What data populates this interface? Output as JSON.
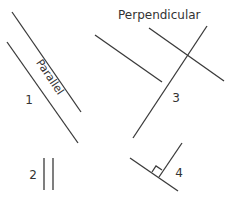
{
  "diagram": {
    "title": "Perpendicular",
    "parallel_label": "Parallel",
    "line_color": "#3a3a3a",
    "text_color": "#333333",
    "figures": [
      {
        "number": "1",
        "type": "parallel",
        "description": "two diagonal parallel lines labeled Parallel"
      },
      {
        "number": "2",
        "type": "parallel",
        "description": "two short vertical parallel lines"
      },
      {
        "number": "3",
        "type": "perpendicular",
        "description": "crossing lines with a separate diagonal line"
      },
      {
        "number": "4",
        "type": "perpendicular",
        "description": "two lines meeting at a right angle with a right-angle marker"
      }
    ]
  }
}
